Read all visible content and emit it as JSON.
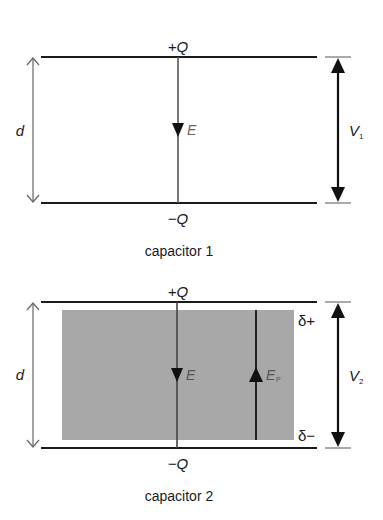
{
  "capacitor1": {
    "caption": "capacitor 1",
    "top_charge": "+Q",
    "bottom_charge": "−Q",
    "field_label": "E",
    "separation_label": "d",
    "voltage_label": "V",
    "voltage_subscript": "1"
  },
  "capacitor2": {
    "caption": "capacitor 2",
    "top_charge": "+Q",
    "bottom_charge": "−Q",
    "field_label": "E",
    "polarization_field_label": "E",
    "polarization_field_subscript": "P",
    "induced_top_charge": "δ+",
    "induced_bottom_charge": "δ−",
    "separation_label": "d",
    "voltage_label": "V",
    "voltage_subscript": "2",
    "dielectric_color": "#a8a8a8"
  },
  "colors": {
    "plate": "#1a1a1a",
    "field_line": "#555555",
    "dimension_line": "#666666",
    "voltage_arrow": "#111111"
  }
}
